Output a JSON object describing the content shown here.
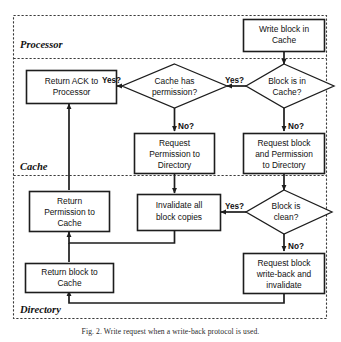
{
  "figure": {
    "caption": "Fig. 2. Write request when a write-back protocol is used.",
    "lanes": [
      {
        "id": "processor",
        "label": "Processor"
      },
      {
        "id": "cache",
        "label": "Cache"
      },
      {
        "id": "directory",
        "label": "Directory"
      }
    ]
  },
  "nodes": {
    "write_block": {
      "label_1": "Write block in",
      "label_2": "Cache",
      "shape": "process",
      "lane": "processor"
    },
    "return_ack": {
      "label_1": "Return ACK to",
      "label_2": "Processor",
      "shape": "process",
      "lane": "cache"
    },
    "cache_has_permission": {
      "label_1": "Cache has",
      "label_2": "permission?",
      "shape": "decision",
      "lane": "cache"
    },
    "block_is_in_cache": {
      "label_1": "Block is in",
      "label_2": "Cache?",
      "shape": "decision",
      "lane": "cache"
    },
    "request_permission": {
      "label_1": "Request",
      "label_2": "Permission to",
      "label_3": "Directory",
      "shape": "process",
      "lane": "cache"
    },
    "request_block_permission": {
      "label_1": "Request block",
      "label_2": "and Permission",
      "label_3": "to Directory",
      "shape": "process",
      "lane": "cache"
    },
    "return_permission": {
      "label_1": "Return",
      "label_2": "Permission to",
      "label_3": "Cache",
      "shape": "process",
      "lane": "directory"
    },
    "invalidate_copies": {
      "label_1": "Invalidate all",
      "label_2": "block copies",
      "shape": "process",
      "lane": "directory"
    },
    "block_is_clean": {
      "label_1": "Block is",
      "label_2": "clean?",
      "shape": "decision",
      "lane": "directory"
    },
    "request_writeback": {
      "label_1": "Request block",
      "label_2": "write-back and",
      "label_3": "invalidate",
      "shape": "process",
      "lane": "directory"
    },
    "return_block": {
      "label_1": "Return block to",
      "label_2": "Cache",
      "shape": "process",
      "lane": "directory"
    }
  },
  "edge_labels": {
    "cache_permission_yes": "Yes?",
    "cache_permission_no": "No?",
    "block_in_cache_yes": "Yes?",
    "block_in_cache_no": "No?",
    "block_clean_yes": "Yes?",
    "block_clean_no": "No?"
  },
  "colors": {
    "node_stroke": "#1d1d1d",
    "lane_stroke": "#3a3a3a",
    "background": "#ffffff",
    "text": "#111111"
  }
}
